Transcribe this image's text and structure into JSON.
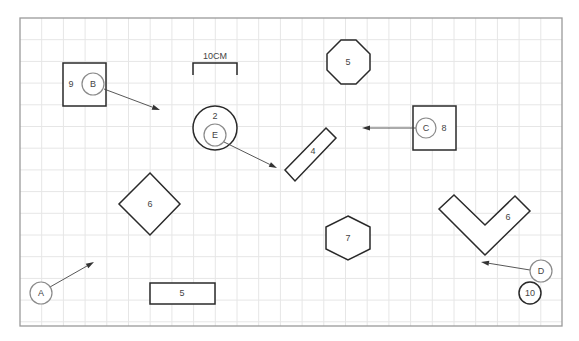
{
  "diagram": {
    "frame": {
      "x": 20,
      "y": 18,
      "width": 542,
      "height": 308
    },
    "grid": {
      "spacing": 21.7,
      "color": "#e6e6e6"
    },
    "scale_bar": {
      "label": "10CM",
      "x1": 193,
      "x2": 237,
      "y_top": 63,
      "y_bottom": 75
    },
    "shapes": {
      "square_9": {
        "label": "9",
        "x": 63,
        "y": 63,
        "w": 43,
        "h": 43,
        "label_x": 71,
        "label_y": 84
      },
      "circle_2": {
        "label": "2",
        "cx": 215,
        "cy": 128,
        "r": 22,
        "label_x": 215,
        "label_y": 116
      },
      "octagon_5": {
        "label": "5",
        "points": "341,40 356,40 370,54 370,70 356,84 341,84 327,70 327,54",
        "label_x": 348,
        "label_y": 62
      },
      "square_8": {
        "label": "8",
        "x": 413,
        "y": 106,
        "w": 43,
        "h": 44,
        "label_x": 444,
        "label_y": 128
      },
      "rotrect_4": {
        "label": "4",
        "points": "326,128 336,138 295,181 285,170",
        "label_x": 313,
        "label_y": 151
      },
      "diamond_6": {
        "label": "6",
        "points": "150,173 180,204 150,235 119,204",
        "label_x": 150,
        "label_y": 204
      },
      "hexagon_7": {
        "label": "7",
        "points": "348,216 370,227 370,249 348,260 326,249 326,227",
        "label_x": 348,
        "label_y": 238
      },
      "vshape_6": {
        "label": "6",
        "points": "454,195 485,225 515,196 530,211 485,255 439,209",
        "label_x": 508,
        "label_y": 217
      },
      "rect_5": {
        "label": "5",
        "x": 150,
        "y": 283,
        "w": 65,
        "h": 21,
        "label_x": 182,
        "label_y": 293
      },
      "circle_10": {
        "label": "10",
        "cx": 530,
        "cy": 293,
        "r": 11
      }
    },
    "markers": [
      {
        "id": "A",
        "label": "A",
        "cx": 41,
        "cy": 293,
        "r": 11,
        "arrow": {
          "x1": 50,
          "y1": 287,
          "x2": 94,
          "y2": 262
        }
      },
      {
        "id": "B",
        "label": "B",
        "cx": 93,
        "cy": 84,
        "r": 11,
        "arrow": {
          "x1": 104,
          "y1": 89,
          "x2": 160,
          "y2": 110
        }
      },
      {
        "id": "C",
        "label": "C",
        "cx": 426,
        "cy": 128,
        "r": 10,
        "arrow": {
          "x1": 416,
          "y1": 128,
          "x2": 362,
          "y2": 128
        }
      },
      {
        "id": "D",
        "label": "D",
        "cx": 541,
        "cy": 271,
        "r": 11,
        "arrow": {
          "x1": 530,
          "y1": 270,
          "x2": 481,
          "y2": 262
        }
      },
      {
        "id": "E",
        "label": "E",
        "cx": 215,
        "cy": 135,
        "r": 11,
        "arrow": {
          "x1": 224,
          "y1": 142,
          "x2": 277,
          "y2": 168
        }
      }
    ]
  }
}
